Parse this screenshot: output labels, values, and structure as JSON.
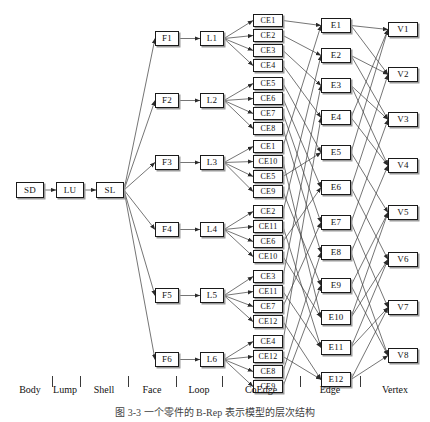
{
  "figure": {
    "caption": "图 3-3  一个零件的 B-Rep 表示模型的层次结构",
    "axis_labels": [
      "Body",
      "Lump",
      "Shell",
      "Face",
      "Loop",
      "CoEdge",
      "Edge",
      "Vertex"
    ]
  },
  "nodes": {
    "body": {
      "label": "SD",
      "x": 16,
      "y": 182
    },
    "lump": {
      "label": "LU",
      "x": 56,
      "y": 182
    },
    "shell": {
      "label": "SL",
      "x": 96,
      "y": 182
    },
    "faces": [
      {
        "label": "F1",
        "x": 155,
        "y": 31
      },
      {
        "label": "F2",
        "x": 155,
        "y": 93
      },
      {
        "label": "F3",
        "x": 155,
        "y": 155
      },
      {
        "label": "F4",
        "x": 155,
        "y": 222
      },
      {
        "label": "F5",
        "x": 155,
        "y": 288
      },
      {
        "label": "F6",
        "x": 155,
        "y": 352
      }
    ],
    "loops": [
      {
        "label": "L1",
        "x": 200,
        "y": 31
      },
      {
        "label": "L2",
        "x": 200,
        "y": 93
      },
      {
        "label": "L3",
        "x": 200,
        "y": 155
      },
      {
        "label": "L4",
        "x": 200,
        "y": 222
      },
      {
        "label": "L5",
        "x": 200,
        "y": 288
      },
      {
        "label": "L6",
        "x": 200,
        "y": 352
      }
    ],
    "coedges": [
      {
        "label": "CE1",
        "x": 253,
        "y": 14
      },
      {
        "label": "CE2",
        "x": 253,
        "y": 29
      },
      {
        "label": "CE3",
        "x": 253,
        "y": 44
      },
      {
        "label": "CE4",
        "x": 253,
        "y": 59
      },
      {
        "label": "CE5",
        "x": 253,
        "y": 77
      },
      {
        "label": "CE6",
        "x": 253,
        "y": 92
      },
      {
        "label": "CE7",
        "x": 253,
        "y": 107
      },
      {
        "label": "CE8",
        "x": 253,
        "y": 122
      },
      {
        "label": "CE1",
        "x": 253,
        "y": 140
      },
      {
        "label": "CE10",
        "x": 253,
        "y": 155
      },
      {
        "label": "CE5",
        "x": 253,
        "y": 170
      },
      {
        "label": "CE9",
        "x": 253,
        "y": 185
      },
      {
        "label": "CE2",
        "x": 253,
        "y": 205
      },
      {
        "label": "CE11",
        "x": 253,
        "y": 220
      },
      {
        "label": "CE6",
        "x": 253,
        "y": 235
      },
      {
        "label": "CE10",
        "x": 253,
        "y": 250
      },
      {
        "label": "CE3",
        "x": 253,
        "y": 270
      },
      {
        "label": "CE11",
        "x": 253,
        "y": 285
      },
      {
        "label": "CE7",
        "x": 253,
        "y": 300
      },
      {
        "label": "CE12",
        "x": 253,
        "y": 315
      },
      {
        "label": "CE4",
        "x": 253,
        "y": 335
      },
      {
        "label": "CE12",
        "x": 253,
        "y": 350
      },
      {
        "label": "CE8",
        "x": 253,
        "y": 365
      },
      {
        "label": "CE9",
        "x": 253,
        "y": 380
      }
    ],
    "edges": [
      {
        "label": "E1",
        "x": 321,
        "y": 18
      },
      {
        "label": "E2",
        "x": 321,
        "y": 48
      },
      {
        "label": "E3",
        "x": 321,
        "y": 78
      },
      {
        "label": "E4",
        "x": 321,
        "y": 110
      },
      {
        "label": "E5",
        "x": 321,
        "y": 145
      },
      {
        "label": "E6",
        "x": 321,
        "y": 180
      },
      {
        "label": "E7",
        "x": 321,
        "y": 215
      },
      {
        "label": "E8",
        "x": 321,
        "y": 245
      },
      {
        "label": "E9",
        "x": 321,
        "y": 278
      },
      {
        "label": "E10",
        "x": 321,
        "y": 310
      },
      {
        "label": "E11",
        "x": 321,
        "y": 340
      },
      {
        "label": "E12",
        "x": 321,
        "y": 372
      }
    ],
    "vertices": [
      {
        "label": "V1",
        "x": 388,
        "y": 22
      },
      {
        "label": "V2",
        "x": 388,
        "y": 67
      },
      {
        "label": "V3",
        "x": 388,
        "y": 112
      },
      {
        "label": "V4",
        "x": 388,
        "y": 158
      },
      {
        "label": "V5",
        "x": 388,
        "y": 205
      },
      {
        "label": "V6",
        "x": 388,
        "y": 252
      },
      {
        "label": "V7",
        "x": 388,
        "y": 300
      },
      {
        "label": "V8",
        "x": 388,
        "y": 348
      }
    ]
  },
  "links": {
    "chain": [
      [
        "body",
        "lump"
      ],
      [
        "lump",
        "shell"
      ]
    ],
    "shell_to_faces": [
      0,
      1,
      2,
      3,
      4,
      5
    ],
    "face_to_loop": [
      [
        0,
        0
      ],
      [
        1,
        1
      ],
      [
        2,
        2
      ],
      [
        3,
        3
      ],
      [
        4,
        4
      ],
      [
        5,
        5
      ]
    ],
    "loop_to_coedges": [
      [
        0,
        [
          0,
          1,
          2,
          3
        ]
      ],
      [
        1,
        [
          4,
          5,
          6,
          7
        ]
      ],
      [
        2,
        [
          8,
          9,
          10,
          11
        ]
      ],
      [
        3,
        [
          12,
          13,
          14,
          15
        ]
      ],
      [
        4,
        [
          16,
          17,
          18,
          19
        ]
      ],
      [
        5,
        [
          20,
          21,
          22,
          23
        ]
      ]
    ],
    "coedge_to_edge": [
      [
        0,
        0
      ],
      [
        1,
        1
      ],
      [
        2,
        2
      ],
      [
        3,
        3
      ],
      [
        4,
        4
      ],
      [
        5,
        5
      ],
      [
        6,
        6
      ],
      [
        7,
        7
      ],
      [
        8,
        0
      ],
      [
        9,
        9
      ],
      [
        10,
        4
      ],
      [
        11,
        8
      ],
      [
        12,
        1
      ],
      [
        13,
        10
      ],
      [
        14,
        5
      ],
      [
        15,
        9
      ],
      [
        16,
        2
      ],
      [
        17,
        10
      ],
      [
        18,
        6
      ],
      [
        19,
        11
      ],
      [
        20,
        3
      ],
      [
        21,
        11
      ],
      [
        22,
        7
      ],
      [
        23,
        8
      ]
    ],
    "edge_to_vertices": [
      [
        0,
        [
          0,
          1
        ]
      ],
      [
        1,
        [
          1,
          2
        ]
      ],
      [
        2,
        [
          2,
          3
        ]
      ],
      [
        3,
        [
          3,
          0
        ]
      ],
      [
        4,
        [
          0,
          4
        ]
      ],
      [
        5,
        [
          1,
          5
        ]
      ],
      [
        6,
        [
          2,
          6
        ]
      ],
      [
        7,
        [
          3,
          7
        ]
      ],
      [
        8,
        [
          4,
          7
        ]
      ],
      [
        9,
        [
          4,
          5
        ]
      ],
      [
        10,
        [
          5,
          6
        ]
      ],
      [
        11,
        [
          6,
          7
        ]
      ]
    ]
  },
  "axis": {
    "ticks_x": [
      52,
      80,
      128,
      176,
      222,
      300,
      360
    ],
    "labels": [
      {
        "text": "Body",
        "x": 30
      },
      {
        "text": "Lump",
        "x": 65
      },
      {
        "text": "Shell",
        "x": 104
      },
      {
        "text": "Face",
        "x": 152
      },
      {
        "text": "Loop",
        "x": 199
      },
      {
        "text": "CoEdge",
        "x": 261
      },
      {
        "text": "Edge",
        "x": 330
      },
      {
        "text": "Vertex",
        "x": 395
      }
    ]
  },
  "style": {
    "line_color": "#3a3a3a",
    "box_border": "#1a1a1a",
    "shadow": "#9a9a9a",
    "text_color": "#111111"
  }
}
